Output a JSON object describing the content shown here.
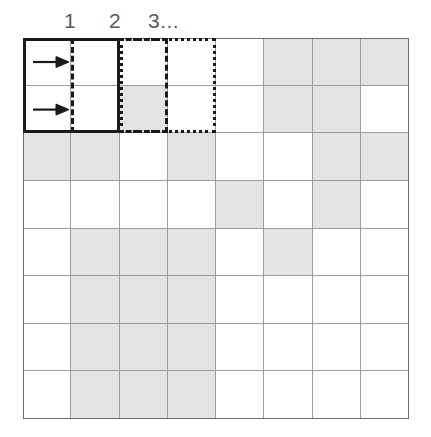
{
  "figure": {
    "colors": {
      "shaded_cell": "#e3e3e3",
      "empty_cell": "#ffffff",
      "grid_line": "#9d9d9d",
      "grid_border": "#6e6e6e",
      "window_outline": "#1a1a1a",
      "label_text": "#5a5a5a"
    }
  },
  "column_labels": [
    {
      "text": "1",
      "x": 64
    },
    {
      "text": "2",
      "x": 109
    },
    {
      "text": "3...",
      "x": 148
    }
  ],
  "grid": {
    "rows": 8,
    "cols": 8,
    "legend": {
      "0": "empty",
      "1": "shaded"
    },
    "matrix": [
      [
        0,
        0,
        0,
        0,
        0,
        1,
        1,
        1
      ],
      [
        0,
        0,
        1,
        0,
        0,
        1,
        1,
        0
      ],
      [
        1,
        1,
        0,
        1,
        0,
        0,
        1,
        1
      ],
      [
        0,
        0,
        0,
        0,
        1,
        0,
        1,
        0
      ],
      [
        0,
        1,
        1,
        1,
        0,
        1,
        0,
        0
      ],
      [
        0,
        1,
        1,
        1,
        0,
        0,
        0,
        0
      ],
      [
        0,
        1,
        1,
        1,
        0,
        0,
        0,
        0
      ],
      [
        0,
        1,
        1,
        1,
        0,
        0,
        0,
        0
      ]
    ]
  },
  "arrows": [
    {
      "name": "row-1-arrow",
      "row": 1,
      "col": 1
    },
    {
      "name": "row-2-arrow",
      "row": 2,
      "col": 1
    }
  ],
  "windows": [
    {
      "name": "window-1",
      "label": "1",
      "style": "solid",
      "start_col": 1,
      "end_col": 2,
      "start_row": 1,
      "end_row": 2
    },
    {
      "name": "window-2",
      "label": "2",
      "style": "dashed",
      "start_col": 2,
      "end_col": 3,
      "start_row": 1,
      "end_row": 2
    },
    {
      "name": "window-3",
      "label": "3...",
      "style": "dotted",
      "start_col": 3,
      "end_col": 4,
      "start_row": 1,
      "end_row": 2
    }
  ]
}
